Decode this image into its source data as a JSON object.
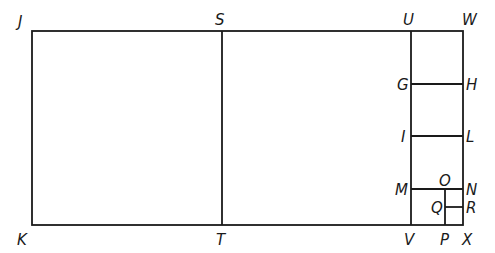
{
  "diagram": {
    "colors": {
      "line": "#1a1a1a",
      "background": "#ffffff"
    },
    "points": {
      "J": {
        "label": "J",
        "x": 32,
        "y": 31
      },
      "S": {
        "label": "S",
        "x": 222,
        "y": 31
      },
      "U": {
        "label": "U",
        "x": 411,
        "y": 31
      },
      "W": {
        "label": "W",
        "x": 463,
        "y": 31
      },
      "K": {
        "label": "K",
        "x": 32,
        "y": 225
      },
      "T": {
        "label": "T",
        "x": 222,
        "y": 225
      },
      "V": {
        "label": "V",
        "x": 411,
        "y": 225
      },
      "X": {
        "label": "X",
        "x": 463,
        "y": 225
      },
      "G": {
        "label": "G",
        "x": 411,
        "y": 84
      },
      "H": {
        "label": "H",
        "x": 463,
        "y": 84
      },
      "I": {
        "label": "I",
        "x": 411,
        "y": 136
      },
      "L": {
        "label": "L",
        "x": 463,
        "y": 136
      },
      "M": {
        "label": "M",
        "x": 411,
        "y": 189
      },
      "N": {
        "label": "N",
        "x": 463,
        "y": 189
      },
      "O": {
        "label": "O",
        "x": 445,
        "y": 189
      },
      "P": {
        "label": "P",
        "x": 445,
        "y": 225
      },
      "Q": {
        "label": "Q",
        "x": 445,
        "y": 207
      },
      "R": {
        "label": "R",
        "x": 463,
        "y": 207
      }
    },
    "segments": [
      [
        "J",
        "W"
      ],
      [
        "K",
        "X"
      ],
      [
        "J",
        "K"
      ],
      [
        "W",
        "X"
      ],
      [
        "S",
        "T"
      ],
      [
        "U",
        "V"
      ],
      [
        "G",
        "H"
      ],
      [
        "I",
        "L"
      ],
      [
        "M",
        "N"
      ],
      [
        "O",
        "P"
      ],
      [
        "Q",
        "R"
      ]
    ]
  }
}
